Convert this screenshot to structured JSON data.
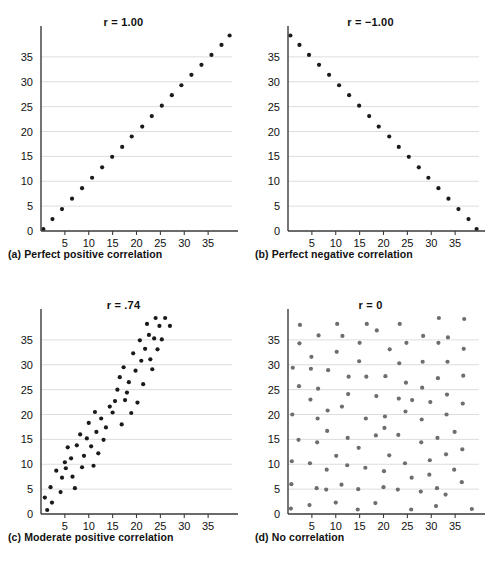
{
  "figure": {
    "background": "#ffffff",
    "point_color_dark": "#1a1a1a",
    "point_color_gray": "#6e6e6e",
    "gridline_color": "#d4d4d4",
    "axis_color": "#3a3a3a"
  },
  "panels": [
    {
      "id": "a",
      "title": "r = 1.00",
      "caption": "(a) Perfect positive correlation",
      "point_color": "#1a1a1a",
      "point_radius": 2.1
    },
    {
      "id": "b",
      "title": "r = −1.00",
      "caption": "(b) Perfect negative correlation",
      "point_color": "#1a1a1a",
      "point_radius": 2.1
    },
    {
      "id": "c",
      "title": "r = .74",
      "caption": "(c) Moderate positive correlation",
      "point_color": "#1a1a1a",
      "point_radius": 2.1
    },
    {
      "id": "d",
      "title": "r = 0",
      "caption": "(d) No correlation",
      "point_color": "#6e6e6e",
      "point_radius": 2.1
    }
  ],
  "chart_data": [
    {
      "type": "scatter",
      "id": "a",
      "title": "r = 1.00",
      "caption": "(a) Perfect positive correlation",
      "xlabel": "",
      "ylabel": "",
      "xlim": [
        0,
        40
      ],
      "ylim": [
        0,
        40
      ],
      "xticks": [
        5,
        10,
        15,
        20,
        25,
        30,
        35
      ],
      "yticks": [
        0,
        5,
        10,
        15,
        20,
        25,
        30,
        35
      ],
      "grid": "horizontal",
      "legend": "none",
      "marker_color": "#1a1a1a",
      "points": [
        [
          0.5,
          0.4
        ],
        [
          2.4,
          2.4
        ],
        [
          4.4,
          4.4
        ],
        [
          6.5,
          6.5
        ],
        [
          8.6,
          8.6
        ],
        [
          10.7,
          10.7
        ],
        [
          12.8,
          12.8
        ],
        [
          14.9,
          14.9
        ],
        [
          17.0,
          16.9
        ],
        [
          19.0,
          19.0
        ],
        [
          21.2,
          21.0
        ],
        [
          23.2,
          23.1
        ],
        [
          25.3,
          25.2
        ],
        [
          27.4,
          27.3
        ],
        [
          29.4,
          29.3
        ],
        [
          31.5,
          31.4
        ],
        [
          33.6,
          33.4
        ],
        [
          35.7,
          35.4
        ],
        [
          37.8,
          37.4
        ],
        [
          39.5,
          39.3
        ]
      ]
    },
    {
      "type": "scatter",
      "id": "b",
      "title": "r = -1.00",
      "caption": "(b) Perfect negative correlation",
      "xlabel": "",
      "ylabel": "",
      "xlim": [
        0,
        40
      ],
      "ylim": [
        0,
        40
      ],
      "xticks": [
        5,
        10,
        15,
        20,
        25,
        30,
        35
      ],
      "yticks": [
        0,
        5,
        10,
        15,
        20,
        25,
        30,
        35
      ],
      "grid": "horizontal",
      "legend": "none",
      "marker_color": "#1a1a1a",
      "points": [
        [
          0.5,
          39.3
        ],
        [
          2.4,
          37.4
        ],
        [
          4.4,
          35.4
        ],
        [
          6.5,
          33.4
        ],
        [
          8.6,
          31.4
        ],
        [
          10.7,
          29.3
        ],
        [
          12.8,
          27.3
        ],
        [
          14.9,
          25.2
        ],
        [
          17.0,
          23.1
        ],
        [
          19.0,
          21.0
        ],
        [
          21.2,
          19.0
        ],
        [
          23.2,
          16.9
        ],
        [
          25.3,
          14.9
        ],
        [
          27.4,
          12.8
        ],
        [
          29.4,
          10.7
        ],
        [
          31.5,
          8.6
        ],
        [
          33.6,
          6.5
        ],
        [
          35.7,
          4.4
        ],
        [
          37.8,
          2.4
        ],
        [
          39.5,
          0.4
        ]
      ]
    },
    {
      "type": "scatter",
      "id": "c",
      "title": "r = .74",
      "caption": "(c) Moderate positive correlation",
      "xlabel": "",
      "ylabel": "",
      "xlim": [
        0,
        40
      ],
      "ylim": [
        0,
        40
      ],
      "xticks": [
        5,
        10,
        15,
        20,
        25,
        30,
        35
      ],
      "yticks": [
        0,
        5,
        10,
        15,
        20,
        25,
        30,
        35
      ],
      "grid": "horizontal",
      "legend": "none",
      "marker_color": "#1a1a1a",
      "points": [
        [
          0.8,
          3.3
        ],
        [
          1.3,
          0.8
        ],
        [
          2.0,
          5.4
        ],
        [
          2.3,
          2.3
        ],
        [
          3.2,
          8.7
        ],
        [
          4.1,
          4.4
        ],
        [
          4.4,
          7.3
        ],
        [
          5.0,
          10.4
        ],
        [
          5.2,
          9.2
        ],
        [
          5.6,
          13.4
        ],
        [
          6.3,
          11.2
        ],
        [
          6.6,
          7.5
        ],
        [
          7.1,
          5.2
        ],
        [
          7.5,
          13.8
        ],
        [
          8.2,
          16.0
        ],
        [
          8.6,
          9.4
        ],
        [
          9.0,
          11.7
        ],
        [
          9.6,
          15.2
        ],
        [
          10.0,
          18.3
        ],
        [
          10.5,
          13.6
        ],
        [
          11.0,
          9.7
        ],
        [
          11.3,
          20.5
        ],
        [
          11.6,
          16.5
        ],
        [
          12.0,
          12.2
        ],
        [
          12.6,
          19.2
        ],
        [
          13.1,
          14.9
        ],
        [
          13.6,
          17.4
        ],
        [
          14.4,
          21.6
        ],
        [
          15.0,
          20.4
        ],
        [
          15.5,
          22.7
        ],
        [
          16.0,
          25.0
        ],
        [
          16.5,
          27.5
        ],
        [
          16.9,
          18.0
        ],
        [
          17.3,
          29.5
        ],
        [
          17.6,
          22.9
        ],
        [
          18.0,
          24.4
        ],
        [
          18.4,
          26.5
        ],
        [
          18.9,
          20.3
        ],
        [
          19.3,
          32.3
        ],
        [
          19.8,
          28.8
        ],
        [
          20.2,
          22.4
        ],
        [
          20.7,
          34.9
        ],
        [
          21.0,
          30.8
        ],
        [
          21.4,
          26.1
        ],
        [
          21.8,
          33.2
        ],
        [
          22.2,
          38.2
        ],
        [
          22.6,
          36.0
        ],
        [
          22.9,
          31.1
        ],
        [
          23.3,
          29.1
        ],
        [
          23.7,
          35.3
        ],
        [
          24.0,
          39.4
        ],
        [
          24.4,
          33.1
        ],
        [
          24.8,
          37.8
        ],
        [
          25.3,
          35.1
        ],
        [
          26.0,
          39.4
        ],
        [
          27.0,
          37.8
        ]
      ]
    },
    {
      "type": "scatter",
      "id": "d",
      "title": "r = 0",
      "caption": "(d) No correlation",
      "xlabel": "",
      "ylabel": "",
      "xlim": [
        0,
        40
      ],
      "ylim": [
        0,
        40
      ],
      "xticks": [
        5,
        10,
        15,
        20,
        25,
        30,
        35
      ],
      "yticks": [
        0,
        5,
        10,
        15,
        20,
        25,
        30,
        35
      ],
      "grid": "horizontal",
      "legend": "none",
      "marker_color": "#6e6e6e",
      "points": [
        [
          0.6,
          1.1
        ],
        [
          0.7,
          6.0
        ],
        [
          0.8,
          10.6
        ],
        [
          0.9,
          20.0
        ],
        [
          1.0,
          29.4
        ],
        [
          2.2,
          14.9
        ],
        [
          2.3,
          25.7
        ],
        [
          2.4,
          34.3
        ],
        [
          2.5,
          38.0
        ],
        [
          4.5,
          1.8
        ],
        [
          4.6,
          10.2
        ],
        [
          4.7,
          23.0
        ],
        [
          4.8,
          29.2
        ],
        [
          4.9,
          31.6
        ],
        [
          6.0,
          5.2
        ],
        [
          6.1,
          14.4
        ],
        [
          6.2,
          19.2
        ],
        [
          6.3,
          25.2
        ],
        [
          6.4,
          35.9
        ],
        [
          8.0,
          4.9
        ],
        [
          8.1,
          8.9
        ],
        [
          8.2,
          16.7
        ],
        [
          8.3,
          20.8
        ],
        [
          8.4,
          28.9
        ],
        [
          10.0,
          2.3
        ],
        [
          10.1,
          11.7
        ],
        [
          10.2,
          32.6
        ],
        [
          10.3,
          38.2
        ],
        [
          11.2,
          5.9
        ],
        [
          11.3,
          21.6
        ],
        [
          11.4,
          35.8
        ],
        [
          12.4,
          9.8
        ],
        [
          12.5,
          15.3
        ],
        [
          12.6,
          24.1
        ],
        [
          12.7,
          27.6
        ],
        [
          14.6,
          0.9
        ],
        [
          14.7,
          5.0
        ],
        [
          14.8,
          13.3
        ],
        [
          14.9,
          30.7
        ],
        [
          15.0,
          34.4
        ],
        [
          16.2,
          9.3
        ],
        [
          16.3,
          19.2
        ],
        [
          16.4,
          27.6
        ],
        [
          16.5,
          38.2
        ],
        [
          18.3,
          2.2
        ],
        [
          18.4,
          15.8
        ],
        [
          18.5,
          23.7
        ],
        [
          18.6,
          36.9
        ],
        [
          20.0,
          5.4
        ],
        [
          20.1,
          8.6
        ],
        [
          20.2,
          17.3
        ],
        [
          20.3,
          19.6
        ],
        [
          20.4,
          27.7
        ],
        [
          21.2,
          11.8
        ],
        [
          21.3,
          33.1
        ],
        [
          23.0,
          4.9
        ],
        [
          23.1,
          15.9
        ],
        [
          23.2,
          23.2
        ],
        [
          23.3,
          30.3
        ],
        [
          23.4,
          38.2
        ],
        [
          24.5,
          10.2
        ],
        [
          24.6,
          20.6
        ],
        [
          24.7,
          26.4
        ],
        [
          24.8,
          34.4
        ],
        [
          25.8,
          0.9
        ],
        [
          25.9,
          7.3
        ],
        [
          26.0,
          22.9
        ],
        [
          27.8,
          4.5
        ],
        [
          27.9,
          14.4
        ],
        [
          28.0,
          19.0
        ],
        [
          28.1,
          25.4
        ],
        [
          28.2,
          30.6
        ],
        [
          28.3,
          35.8
        ],
        [
          29.6,
          7.9
        ],
        [
          29.7,
          10.8
        ],
        [
          29.8,
          22.5
        ],
        [
          31.0,
          1.6
        ],
        [
          31.2,
          5.2
        ],
        [
          31.3,
          15.3
        ],
        [
          31.4,
          27.3
        ],
        [
          31.5,
          34.4
        ],
        [
          31.6,
          39.4
        ],
        [
          33.0,
          3.9
        ],
        [
          33.1,
          12.0
        ],
        [
          33.2,
          20.0
        ],
        [
          33.3,
          24.0
        ],
        [
          33.4,
          30.6
        ],
        [
          33.5,
          35.5
        ],
        [
          34.8,
          8.9
        ],
        [
          34.9,
          16.5
        ],
        [
          36.4,
          6.4
        ],
        [
          36.5,
          13.0
        ],
        [
          36.6,
          22.2
        ],
        [
          36.7,
          27.8
        ],
        [
          36.8,
          33.2
        ],
        [
          36.9,
          39.2
        ],
        [
          38.5,
          1.0
        ]
      ]
    }
  ]
}
